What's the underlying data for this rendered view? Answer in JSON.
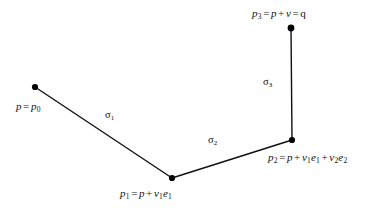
{
  "figure": {
    "type": "piecewise-linear-path-diagram",
    "background_color": "#ffffff",
    "stroke_color": "#111111",
    "vertex_color": "#000000",
    "width": 385,
    "height": 212
  },
  "vertices": [
    {
      "id": "p0",
      "x": 35,
      "y": 87,
      "label": "p = p0"
    },
    {
      "id": "p1",
      "x": 172,
      "y": 178,
      "label": "p1 = p + v1e1"
    },
    {
      "id": "p2",
      "x": 292,
      "y": 140,
      "label": "p2 = p + v1e1 + v2e2"
    },
    {
      "id": "p3",
      "x": 291,
      "y": 28,
      "label": "p3 = p + v = q"
    }
  ],
  "segments": [
    {
      "id": "sigma1",
      "from": "p0",
      "to": "p1",
      "label": "σ1"
    },
    {
      "id": "sigma2",
      "from": "p1",
      "to": "p2",
      "label": "σ2"
    },
    {
      "id": "sigma3",
      "from": "p2",
      "to": "p3",
      "label": "σ3"
    }
  ],
  "labels": {
    "p0": {
      "base": "p",
      "eq": "=",
      "rhs_var": "p",
      "rhs_sub": "0"
    },
    "p1": {
      "var": "p",
      "sub": "1",
      "eq": "=",
      "terms": [
        "p",
        "v1e1"
      ]
    },
    "p2": {
      "var": "p",
      "sub": "2",
      "eq": "=",
      "terms": [
        "p",
        "v1e1",
        "v2e2"
      ]
    },
    "p3": {
      "var": "p",
      "sub": "3",
      "eq": "=",
      "terms": [
        "p",
        "v"
      ],
      "eq2": "=",
      "result": "q"
    },
    "sigma1": {
      "glyph": "σ",
      "sub": "1"
    },
    "sigma2": {
      "glyph": "σ",
      "sub": "2"
    },
    "sigma3": {
      "glyph": "σ",
      "sub": "3"
    }
  }
}
